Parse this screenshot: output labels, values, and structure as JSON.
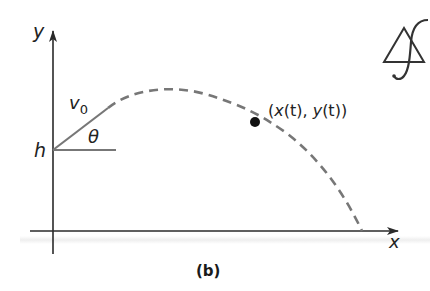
{
  "figure": {
    "caption": "(b)"
  },
  "axes": {
    "x_label": "x",
    "y_label": "y"
  },
  "labels": {
    "height": "h",
    "initial_velocity_base": "v",
    "initial_velocity_sub": "0",
    "angle": "θ",
    "point_open": "(",
    "point_x": "x",
    "point_xt": "(t)",
    "point_sep": ", ",
    "point_y": "y",
    "point_yt": "(t)",
    "point_close": ")"
  },
  "colors": {
    "axis": "#2a2a2a",
    "trajectory": "#777777",
    "launch_vector": "#777777",
    "point": "#111111",
    "text": "#222222"
  },
  "logo": {
    "icon": "triangle-integral-logo"
  }
}
